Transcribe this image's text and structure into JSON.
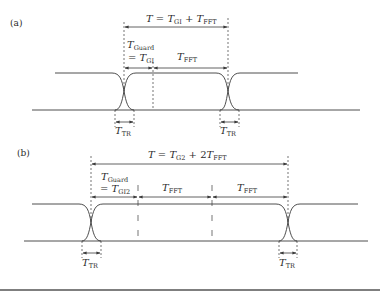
{
  "colors": {
    "line": "#3a3a3a",
    "text": "#2a2a2a",
    "background": "#ffffff",
    "border": "#555555"
  },
  "panel_a": {
    "label": "(a)",
    "period": {
      "T": "T",
      "eq": " = ",
      "t1": "T",
      "s1": "GI",
      "plus": " + ",
      "t2": "T",
      "s2": "FFT"
    },
    "guard": {
      "t": "T",
      "s": "Guard",
      "eq": "= ",
      "t2": "T",
      "s2": "GI"
    },
    "fft": {
      "t": "T",
      "s": "FFT"
    },
    "tr_left": {
      "t": "T",
      "s": "TR"
    },
    "tr_right": {
      "t": "T",
      "s": "TR"
    }
  },
  "panel_b": {
    "label": "(b)",
    "period": {
      "T": "T",
      "eq": " = ",
      "t1": "T",
      "s1": "G2",
      "plus": " + 2",
      "t2": "T",
      "s2": "FFT"
    },
    "guard": {
      "t": "T",
      "s": "Guard",
      "eq": "= ",
      "t2": "T",
      "s2": "GI2"
    },
    "fft1": {
      "t": "T",
      "s": "FFT"
    },
    "fft2": {
      "t": "T",
      "s": "FFT"
    },
    "tr_left": {
      "t": "T",
      "s": "TR"
    },
    "tr_right": {
      "t": "T",
      "s": "TR"
    }
  }
}
